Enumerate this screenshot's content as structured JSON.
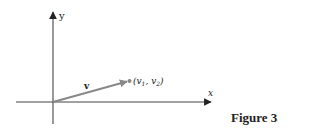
{
  "figure": {
    "caption": "Figure 3.6",
    "axes": {
      "x_label": "x",
      "y_label": "y"
    },
    "vector": {
      "label": "v",
      "point_label_open": "(",
      "v1_base": "v",
      "v1_sub": "1",
      "separator": ", ",
      "v2_base": "v",
      "v2_sub": "2",
      "point_label_close": ")"
    },
    "colors": {
      "axis": "#333333",
      "vector": "#888888",
      "point": "#888888",
      "text": "#222222"
    }
  }
}
